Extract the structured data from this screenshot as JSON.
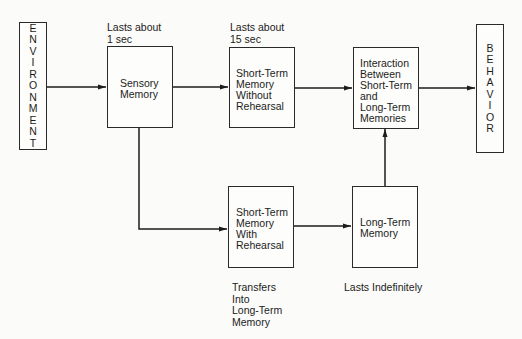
{
  "diagram": {
    "type": "flowchart",
    "title": "",
    "nodes": {
      "environment": {
        "label": "ENVIRONMENT",
        "letters": [
          "E",
          "N",
          "V",
          "I",
          "R",
          "O",
          "N",
          "M",
          "E",
          "N",
          "T"
        ]
      },
      "sensory": {
        "lines": [
          "Sensory",
          "Memory"
        ],
        "note": [
          "Lasts about",
          "1 sec"
        ]
      },
      "stm_without": {
        "lines": [
          "Short-Term",
          "Memory",
          "Without",
          "Rehearsal"
        ],
        "note": [
          "Lasts about",
          "15 sec"
        ]
      },
      "interaction": {
        "lines": [
          "Interaction",
          "Between",
          "Short-Term",
          "and",
          "Long-Term",
          "Memories"
        ]
      },
      "behavior": {
        "label": "BEHAVIOR",
        "letters": [
          "B",
          "E",
          "H",
          "A",
          "V",
          "I",
          "O",
          "R"
        ]
      },
      "stm_with": {
        "lines": [
          "Short-Term",
          "Memory",
          "With",
          "Rehearsal"
        ],
        "note": [
          "Transfers",
          "Into",
          "Long-Term",
          "Memory"
        ]
      },
      "ltm": {
        "lines": [
          "Long-Term",
          "Memory"
        ],
        "note": [
          "Lasts Indefinitely"
        ]
      }
    },
    "edges": [
      {
        "from": "environment",
        "to": "sensory"
      },
      {
        "from": "sensory",
        "to": "stm_without"
      },
      {
        "from": "stm_without",
        "to": "interaction"
      },
      {
        "from": "interaction",
        "to": "behavior"
      },
      {
        "from": "sensory",
        "to": "stm_with"
      },
      {
        "from": "stm_with",
        "to": "ltm"
      },
      {
        "from": "ltm",
        "to": "interaction"
      }
    ]
  }
}
